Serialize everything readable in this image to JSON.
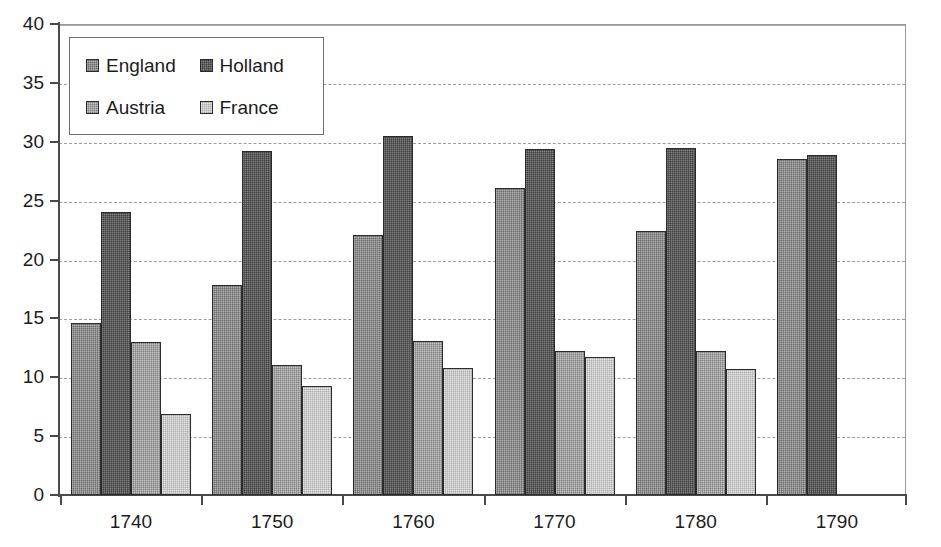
{
  "chart_data": {
    "type": "bar",
    "title": "",
    "subtitle": "",
    "xlabel": "",
    "ylabel": "",
    "categories": [
      "1740",
      "1750",
      "1760",
      "1770",
      "1780",
      "1790"
    ],
    "series": [
      {
        "name": "England",
        "color": "#8d8d8d",
        "values": [
          14.6,
          17.8,
          22.1,
          26.1,
          22.4,
          28.5
        ]
      },
      {
        "name": "Holland",
        "color": "#5c5c5c",
        "values": [
          24.0,
          29.2,
          30.5,
          29.4,
          29.5,
          28.9
        ]
      },
      {
        "name": "Austria",
        "color": "#a0a0a0",
        "values": [
          13.0,
          11.0,
          13.1,
          12.2,
          12.2,
          null
        ]
      },
      {
        "name": "France",
        "color": "#c9c9c9",
        "values": [
          6.9,
          9.3,
          10.8,
          11.7,
          10.7,
          null
        ]
      }
    ],
    "ylim": [
      0,
      40
    ],
    "ytick_step": 5,
    "ytick_labels": [
      "0",
      "5",
      "10",
      "15",
      "20",
      "25",
      "30",
      "35",
      "40"
    ],
    "grid": true,
    "grid_style": "dashed-horizontal",
    "legend_position": "top-left-inside",
    "legend_layout": "2x2"
  },
  "legend": {
    "entries": [
      {
        "label": "England"
      },
      {
        "label": "Holland"
      },
      {
        "label": "Austria"
      },
      {
        "label": "France"
      }
    ]
  }
}
